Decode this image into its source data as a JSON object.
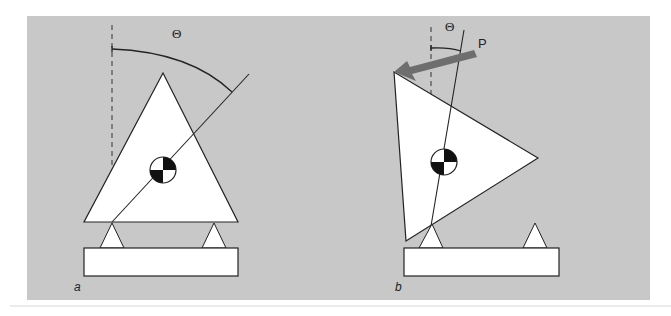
{
  "figure": {
    "background_color": "#c8c8c8",
    "panels": [
      {
        "id": "a",
        "label": "a",
        "angle_label": "Θ",
        "description": "Upright triangle on two supports with center of mass marker; angle Θ measured from vertical dashed line to line through COM"
      },
      {
        "id": "b",
        "label": "b",
        "angle_label": "Θ",
        "force_label": "P",
        "description": "Tilted triangle pivoting on left support under applied force P; small angle Θ between vertical and line through COM"
      }
    ],
    "colors": {
      "panel_bg": "#c8c8c8",
      "shape_fill": "#ffffff",
      "stroke": "#222222",
      "arrow": "#6e6e6e"
    }
  }
}
